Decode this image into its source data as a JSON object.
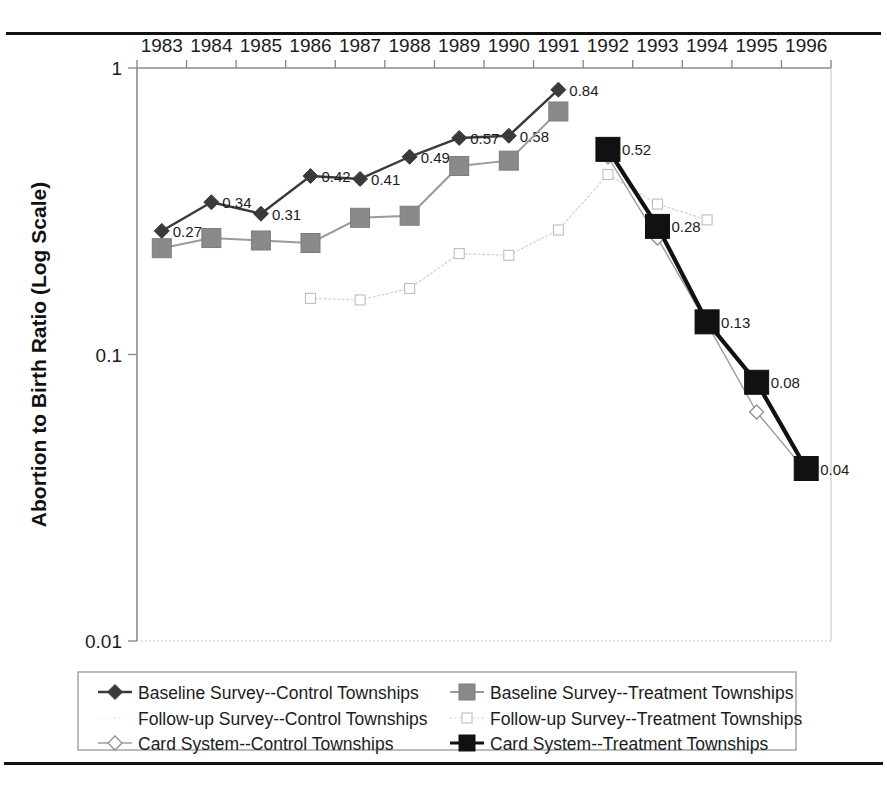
{
  "chart_data": {
    "type": "line",
    "title": "",
    "xlabel": "",
    "ylabel": "Abortion to Birth Ratio (Log Scale)",
    "scale": "log",
    "ylim": [
      0.01,
      1
    ],
    "ytick_labels": [
      "1",
      "0.1",
      "0.01"
    ],
    "ytick_values": [
      1,
      0.1,
      0.01
    ],
    "grid": false,
    "legend_position": "bottom",
    "xtick_position": "top",
    "categories": [
      "1983",
      "1984",
      "1985",
      "1986",
      "1987",
      "1988",
      "1989",
      "1990",
      "1991",
      "1992",
      "1993",
      "1994",
      "1995",
      "1996"
    ],
    "series": [
      {
        "name": "Baseline Survey--Control Townships",
        "marker": "filled-diamond",
        "color": "#3a3a3a",
        "values": [
          0.27,
          0.34,
          0.31,
          0.42,
          0.41,
          0.49,
          0.57,
          0.58,
          0.84,
          null,
          null,
          null,
          null,
          null
        ],
        "point_labels": [
          "0.27",
          "0.34",
          "0.31",
          "0.42",
          "0.41",
          "0.49",
          "0.57",
          "0.58",
          "0.84",
          null,
          null,
          null,
          null,
          null
        ]
      },
      {
        "name": "Baseline Survey--Treatment Townships",
        "marker": "filled-square",
        "color": "#8a8a8a",
        "values": [
          0.235,
          0.255,
          0.25,
          0.245,
          0.3,
          0.305,
          0.455,
          0.475,
          0.705,
          null,
          null,
          null,
          null,
          null
        ],
        "point_labels": [
          null,
          null,
          null,
          null,
          null,
          null,
          null,
          null,
          null,
          null,
          null,
          null,
          null,
          null
        ]
      },
      {
        "name": "Follow-up Survey--Control Townships",
        "marker": "dot",
        "color": "#e8e8e8",
        "values": [
          null,
          null,
          null,
          null,
          null,
          null,
          null,
          null,
          null,
          null,
          null,
          null,
          null,
          null
        ],
        "point_labels": [
          null,
          null,
          null,
          null,
          null,
          null,
          null,
          null,
          null,
          null,
          null,
          null,
          null,
          null
        ]
      },
      {
        "name": "Follow-up Survey--Treatment Townships",
        "marker": "open-square",
        "color": "#c9c9c9",
        "values": [
          null,
          null,
          null,
          0.157,
          0.155,
          0.17,
          0.225,
          0.222,
          0.272,
          0.425,
          0.335,
          0.295,
          null,
          null
        ],
        "point_labels": [
          null,
          null,
          null,
          null,
          null,
          null,
          null,
          null,
          null,
          null,
          null,
          null,
          null,
          null
        ]
      },
      {
        "name": "Card System--Control Townships",
        "marker": "open-diamond",
        "color": "#9b9b9b",
        "values": [
          null,
          null,
          null,
          null,
          null,
          null,
          null,
          null,
          null,
          0.49,
          0.255,
          0.128,
          0.063,
          0.039
        ],
        "point_labels": [
          null,
          null,
          null,
          null,
          null,
          null,
          null,
          null,
          null,
          null,
          null,
          null,
          null,
          null
        ]
      },
      {
        "name": "Card System--Treatment Townships",
        "marker": "filled-square-black",
        "color": "#111111",
        "values": [
          null,
          null,
          null,
          null,
          null,
          null,
          null,
          null,
          null,
          0.52,
          0.28,
          0.13,
          0.08,
          0.04
        ],
        "point_labels": [
          null,
          null,
          null,
          null,
          null,
          null,
          null,
          null,
          null,
          "0.52",
          "0.28",
          "0.13",
          "0.08",
          "0.04"
        ]
      }
    ]
  },
  "legend": {
    "entries": [
      {
        "label": "Baseline Survey--Control Townships",
        "marker": "filled-diamond",
        "color": "#3a3a3a"
      },
      {
        "label": "Baseline Survey--Treatment Townships",
        "marker": "filled-square",
        "color": "#8a8a8a"
      },
      {
        "label": "Follow-up Survey--Control Townships",
        "marker": "dot",
        "color": "#ededed"
      },
      {
        "label": "Follow-up Survey--Treatment Townships",
        "marker": "open-square",
        "color": "#c9c9c9"
      },
      {
        "label": "Card System--Control Townships",
        "marker": "open-diamond",
        "color": "#9b9b9b"
      },
      {
        "label": "Card System--Treatment Townships",
        "marker": "filled-square-black",
        "color": "#111111"
      }
    ]
  }
}
